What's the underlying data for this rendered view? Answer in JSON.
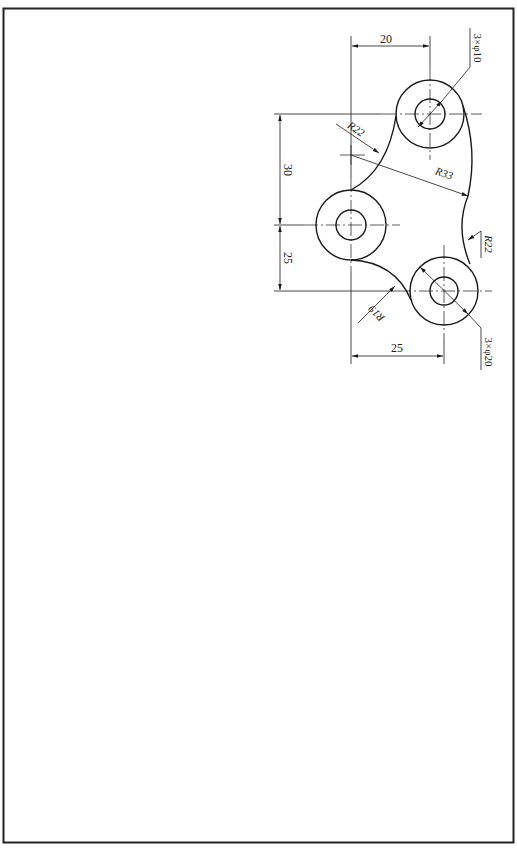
{
  "drawing": {
    "type": "mechanical-part-drawing",
    "dimensions": {
      "top_horizontal": "20",
      "bottom_horizontal": "25",
      "left_upper_vertical": "30",
      "left_lower_vertical": "25",
      "hole_callout_small": "3×φ10",
      "hole_callout_large": "3×φ20",
      "radius_r22_upper": "R22",
      "radius_r33": "R33",
      "radius_r22_right": "R22",
      "radius_r19": "R19"
    },
    "colors": {
      "line": "#1a1a1a",
      "center_line": "#333333",
      "border": "#222222",
      "background": "#ffffff"
    }
  }
}
